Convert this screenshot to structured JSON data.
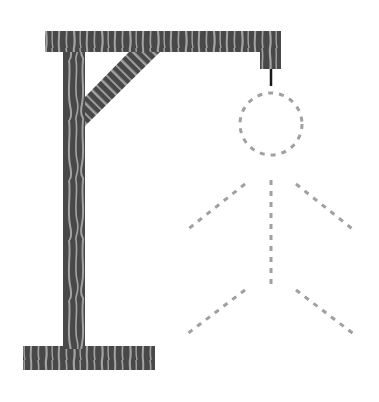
{
  "game": {
    "name": "Hangman",
    "state": "gallows with dashed figure outline (no body parts revealed)",
    "colors": {
      "background": "#ffffff",
      "wood_dark": "#484848",
      "wood_light": "#a3a3a3",
      "rope": "#1a1a1a",
      "figure_dash": "#a0a0a0"
    },
    "gallows": {
      "base": {
        "x": 23,
        "y": 346,
        "w": 132,
        "h": 24
      },
      "post": {
        "x": 63,
        "y": 31,
        "w": 22,
        "h": 318
      },
      "beam": {
        "x": 45,
        "y": 31,
        "w": 236,
        "h": 21
      },
      "hanger": {
        "x": 260,
        "y": 52,
        "w": 21,
        "h": 17
      },
      "brace": "85,97 129,52 160,52 85,126",
      "rope": {
        "x1": 271,
        "y1": 69,
        "x2": 271,
        "y2": 86
      }
    },
    "figure": {
      "head": {
        "cx": 271,
        "cy": 124,
        "r": 31
      },
      "body": {
        "x1": 271,
        "y1": 180,
        "x2": 271,
        "y2": 288
      },
      "left_arm": {
        "x1": 245,
        "y1": 184,
        "x2": 187,
        "y2": 230
      },
      "right_arm": {
        "x1": 296,
        "y1": 184,
        "x2": 355,
        "y2": 231
      },
      "left_leg": {
        "x1": 245,
        "y1": 290,
        "x2": 187,
        "y2": 334
      },
      "right_leg": {
        "x1": 296,
        "y1": 290,
        "x2": 355,
        "y2": 335
      }
    }
  }
}
